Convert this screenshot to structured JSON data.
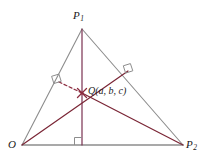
{
  "figure": {
    "background_color": "#ffffff",
    "side_color": "#8d8d8d",
    "cevian_color": "#7a2535",
    "altitude_color": "#7a3050",
    "marker_color": "#8d8d8d",
    "dashed_color": "#8b2b3f"
  },
  "labels": {
    "apex": {
      "name": "P",
      "subscript": "1"
    },
    "origin": {
      "name": "O"
    },
    "right_vertex": {
      "name": "P",
      "subscript": "2"
    },
    "interior_point": {
      "text": "Q(a, b, c)"
    }
  },
  "geometry": {
    "vertices": {
      "P1": {
        "x": 82,
        "y": 29
      },
      "O": {
        "x": 22,
        "y": 145
      },
      "P2": {
        "x": 183,
        "y": 145
      }
    },
    "orthocenter": {
      "x": 82,
      "y": 93
    },
    "feet": {
      "foot_from_P1_on_base": {
        "x": 82,
        "y": 145
      },
      "foot_from_P2_on_OP1": {
        "x": 57,
        "y": 81
      },
      "foot_from_O_on_P1P2": {
        "x": 128,
        "y": 71
      }
    },
    "right_angle_markers": [
      {
        "name": "base-right-angle",
        "x": 82,
        "y": 145
      },
      {
        "name": "left-side-right-angle",
        "x": 57,
        "y": 81
      },
      {
        "name": "right-side-right-angle",
        "x": 128,
        "y": 71
      }
    ]
  }
}
